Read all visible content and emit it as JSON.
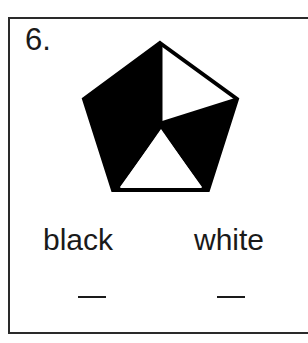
{
  "problem": {
    "number": "6.",
    "labels": {
      "black": "black",
      "white": "white"
    },
    "answers": {
      "black": "",
      "white": ""
    },
    "blank_glyph": "—"
  },
  "figure": {
    "shape": "pentagon",
    "divided_into": 5,
    "regions": [
      {
        "name": "top-left",
        "color": "#000000"
      },
      {
        "name": "top-right",
        "color": "#ffffff"
      },
      {
        "name": "right",
        "color": "#000000"
      },
      {
        "name": "bottom",
        "color": "#ffffff"
      },
      {
        "name": "left",
        "color": "#000000"
      }
    ]
  },
  "colors": {
    "ink": "#1a1a1a",
    "background": "#ffffff"
  }
}
